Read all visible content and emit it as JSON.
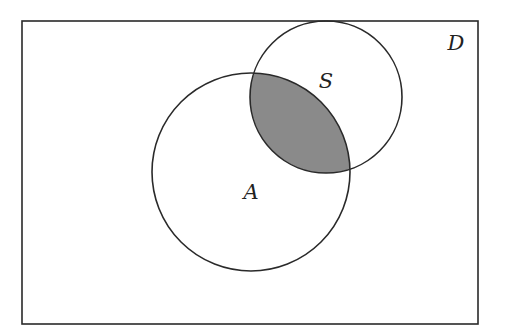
{
  "diagram": {
    "type": "venn",
    "universe": {
      "label": "D",
      "x": 22,
      "y": 21,
      "width": 456,
      "height": 303
    },
    "sets": [
      {
        "label": "A",
        "cx": 251,
        "cy": 172,
        "r": 99,
        "label_x": 251,
        "label_y": 199
      },
      {
        "label": "S",
        "cx": 326,
        "cy": 97,
        "r": 76,
        "label_x": 326,
        "label_y": 88
      }
    ],
    "shaded_region": "A ∩ S",
    "colors": {
      "stroke": "#2a2a2a",
      "shade": "#8a8a8a",
      "background": "#ffffff"
    },
    "universe_label_pos": {
      "x": 456,
      "y": 50
    }
  }
}
